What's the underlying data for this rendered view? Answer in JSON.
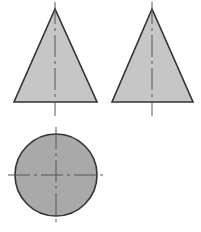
{
  "drawing": {
    "title": "Orthographic projection of a cone",
    "sheet": {
      "width": 201,
      "height": 232,
      "background_color": "#ffffff"
    },
    "styles": {
      "triangle_fill_color": "#c6c6c6",
      "circle_fill_color": "#a9a9a9",
      "outline_color": "#333333",
      "outline_width": 1.6,
      "center_line_color": "#555555",
      "center_line_width": 1,
      "center_line_dash": "22 4 3 4"
    },
    "views": [
      {
        "name": "front-elevation",
        "label": "Front elevation",
        "shape": "triangle",
        "fill": "#c6c6c6",
        "points": "55,9 14,102 97,102",
        "apex_x": 55,
        "apex_y": 9,
        "base_y": 102,
        "base_left_x": 14,
        "base_right_x": 97,
        "center_lines": [
          {
            "name": "vertical-center-line",
            "orientation": "vertical",
            "x1": 55,
            "y1": 2,
            "x2": 55,
            "y2": 116
          }
        ]
      },
      {
        "name": "side-elevation",
        "label": "Side elevation",
        "shape": "triangle",
        "fill": "#c6c6c6",
        "points": "152,9 112,102 193,102",
        "apex_x": 152,
        "apex_y": 9,
        "base_y": 102,
        "base_left_x": 112,
        "base_right_x": 193,
        "center_lines": [
          {
            "name": "vertical-center-line",
            "orientation": "vertical",
            "x1": 152,
            "y1": 2,
            "x2": 152,
            "y2": 116
          }
        ]
      },
      {
        "name": "plan-view",
        "label": "Plan view",
        "shape": "circle",
        "fill": "#a9a9a9",
        "center_x": 56,
        "center_y": 175,
        "radius": 41,
        "center_lines": [
          {
            "name": "vertical-center-line",
            "orientation": "vertical",
            "x1": 56,
            "y1": 127,
            "x2": 56,
            "y2": 226
          },
          {
            "name": "horizontal-center-line",
            "orientation": "horizontal",
            "x1": 8,
            "y1": 175,
            "x2": 106,
            "y2": 175
          }
        ]
      }
    ]
  }
}
